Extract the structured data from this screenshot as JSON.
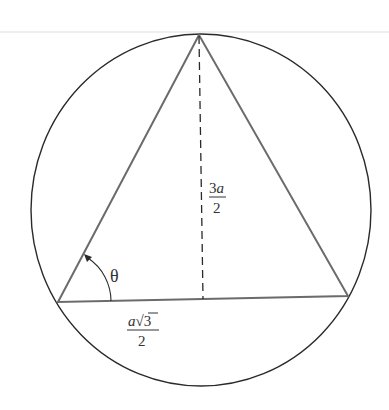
{
  "diagram": {
    "type": "equilateral triangle inscribed in circle",
    "colors": {
      "circle": "#2a2a2a",
      "triangle": "#6b6b6b",
      "altitude": "#2a2a2a",
      "text": "#333333",
      "top_rule": "#eeeeee"
    },
    "labels": {
      "altitude": {
        "numerator_coef": "3",
        "numerator_var": "a",
        "denominator": "2"
      },
      "half_base": {
        "numerator_var": "a",
        "radical": "√",
        "radicand": "3",
        "denominator": "2"
      },
      "angle": "θ"
    }
  }
}
